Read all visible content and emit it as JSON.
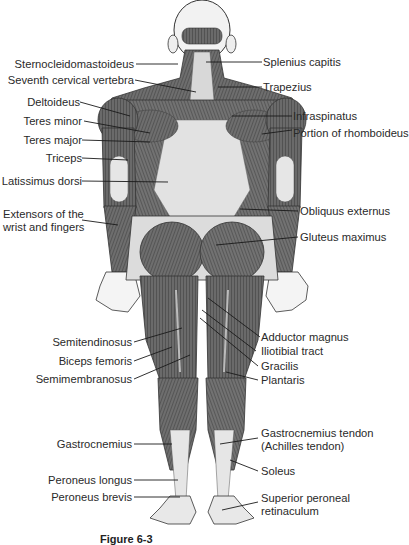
{
  "figure": {
    "caption_prefix": "Figure 6-3",
    "caption_text": "Muscles — posterior view (cropped)",
    "colors": {
      "muscle_dark": "#4a4a4a",
      "muscle_mid": "#8a8a8a",
      "tendon_light": "#dcdcdc",
      "line": "#1a1a1a",
      "text": "#2a2a2a"
    }
  },
  "labels_left": [
    {
      "id": "sternocleidomastoideus",
      "text": "Sternocleidomastoideus"
    },
    {
      "id": "seventh-cervical-vertebra",
      "text": "Seventh cervical vertebra"
    },
    {
      "id": "deltoideus",
      "text": "Deltoideus"
    },
    {
      "id": "teres-minor",
      "text": "Teres minor"
    },
    {
      "id": "teres-major",
      "text": "Teres major"
    },
    {
      "id": "triceps",
      "text": "Triceps"
    },
    {
      "id": "latissimus-dorsi",
      "text": "Latissimus dorsi"
    },
    {
      "id": "extensors-line1",
      "text": "Extensors of the"
    },
    {
      "id": "extensors-line2",
      "text": "wrist and fingers"
    },
    {
      "id": "semitendinosus",
      "text": "Semitendinosus"
    },
    {
      "id": "biceps-femoris",
      "text": "Biceps femoris"
    },
    {
      "id": "semimembranosus",
      "text": "Semimembranosus"
    },
    {
      "id": "gastrocnemius",
      "text": "Gastrocnemius"
    },
    {
      "id": "peroneus-longus",
      "text": "Peroneus longus"
    },
    {
      "id": "peroneus-brevis",
      "text": "Peroneus brevis"
    }
  ],
  "labels_right": [
    {
      "id": "splenius-capitis",
      "text": "Splenius capitis"
    },
    {
      "id": "trapezius",
      "text": "Trapezius"
    },
    {
      "id": "infraspinatus",
      "text": "Infraspinatus"
    },
    {
      "id": "portion-of-rhomboideus",
      "text": "Portion of rhomboideus"
    },
    {
      "id": "obliquus-externus",
      "text": "Obliquus externus"
    },
    {
      "id": "gluteus-maximus",
      "text": "Gluteus maximus"
    },
    {
      "id": "adductor-magnus",
      "text": "Adductor magnus"
    },
    {
      "id": "iliotibial-tract",
      "text": "Iliotibial tract"
    },
    {
      "id": "gracilis",
      "text": "Gracilis"
    },
    {
      "id": "plantaris",
      "text": "Plantaris"
    },
    {
      "id": "gastrocnemius-tendon-line1",
      "text": "Gastrocnemius tendon"
    },
    {
      "id": "gastrocnemius-tendon-line2",
      "text": "(Achilles tendon)"
    },
    {
      "id": "soleus",
      "text": "Soleus"
    },
    {
      "id": "superior-peroneal-line1",
      "text": "Superior peroneal"
    },
    {
      "id": "superior-peroneal-line2",
      "text": "retinaculum"
    }
  ]
}
